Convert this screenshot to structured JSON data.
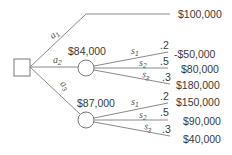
{
  "diagram": {
    "type": "decision-tree",
    "decision_node": {
      "shape": "square"
    },
    "decisions": [
      {
        "label": "a",
        "sub": "1",
        "payoff": "$100,000"
      },
      {
        "label": "a",
        "sub": "2",
        "expected_value": "$84,000",
        "states": [
          {
            "label": "s",
            "sub": "1",
            "prob": ".2",
            "payoff": "-$50,000"
          },
          {
            "label": "s",
            "sub": "2",
            "prob": ".5",
            "payoff": "$80,000"
          },
          {
            "label": "s",
            "sub": "3",
            "prob": ".3",
            "payoff": "$180,000"
          }
        ]
      },
      {
        "label": "a",
        "sub": "3",
        "expected_value": "$87,000",
        "states": [
          {
            "label": "s",
            "sub": "1",
            "prob": ".2",
            "payoff": "$150,000"
          },
          {
            "label": "s",
            "sub": "2",
            "prob": ".5",
            "payoff": "$90,000"
          },
          {
            "label": "s",
            "sub": "3",
            "prob": ".3",
            "payoff": "$40,000"
          }
        ]
      }
    ],
    "colors": {
      "line": "#8a8a8a",
      "text": "#3a3a3a",
      "background": "#ffffff"
    }
  }
}
